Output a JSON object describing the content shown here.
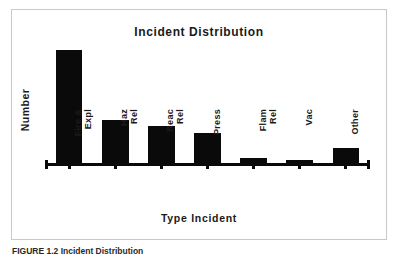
{
  "figure": {
    "caption": "FIGURE 1.2  Incident Distribution"
  },
  "chart_data": {
    "type": "bar",
    "title": "Incident Distribution",
    "xlabel": "Type Incident",
    "ylabel": "Number",
    "grid": false,
    "legend": null,
    "ylim": [
      0,
      100
    ],
    "axis_tick_labels_shown": false,
    "categories": [
      "Fire &\nExpl",
      "Haz\nRel",
      "Reac\nRel",
      "Press",
      "Flam\nRel",
      "Vac",
      "Other"
    ],
    "category_labels_plain": [
      "Fire & Expl",
      "Haz Rel",
      "Reac Rel",
      "Press",
      "Flam Rel",
      "Vac",
      "Other"
    ],
    "values": [
      100,
      38,
      33,
      27,
      4,
      3,
      13
    ],
    "bar_color": "#0a0a0a"
  },
  "style": {
    "frame_color": "#c9c9c9",
    "axis_color": "#0a0a0a",
    "text_color": "#1a1a1a",
    "background": "#ffffff"
  }
}
